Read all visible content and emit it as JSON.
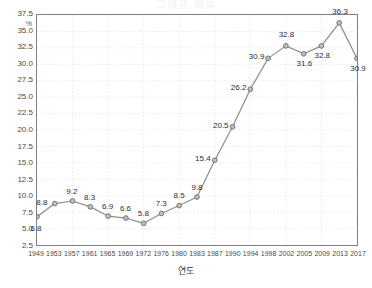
{
  "title_clipped": "그래프 제목",
  "axis": {
    "y_unit": "%",
    "x_title": "연도"
  },
  "chart_data": {
    "type": "line",
    "title": "",
    "xlabel": "연도",
    "ylabel": "%",
    "ylim": [
      2.5,
      37.5
    ],
    "ytick_step": 2.5,
    "yticks": [
      "2.5",
      "5.0",
      "7.5",
      "10.0",
      "12.5",
      "15.0",
      "17.5",
      "20.0",
      "22.5",
      "25.0",
      "27.5",
      "30.0",
      "32.5",
      "35.0",
      "37.5"
    ],
    "grid": true,
    "legend": "none",
    "marker": "circle",
    "line_color": "#8c8c8c",
    "marker_fill": "#bdbdbd",
    "marker_edge": "#6e6e6e",
    "categories": [
      "1949",
      "1953",
      "1957",
      "1961",
      "1965",
      "1969",
      "1972",
      "1976",
      "1980",
      "1983",
      "1987",
      "1990",
      "1994",
      "1998",
      "2002",
      "2005",
      "2009",
      "2013",
      "2017"
    ],
    "values": [
      6.8,
      8.8,
      9.2,
      8.3,
      6.9,
      6.6,
      5.8,
      7.3,
      8.5,
      9.8,
      15.4,
      20.5,
      26.2,
      30.9,
      32.8,
      31.6,
      32.8,
      36.3,
      30.9
    ],
    "point_labels": [
      "6.8",
      "8.8",
      "9.2",
      "8.3",
      "6.9",
      "6.6",
      "5.8",
      "7.3",
      "8.5",
      "9.8",
      "15.4",
      "20.5",
      "26.2",
      "30.9",
      "32.8",
      "31.6",
      "32.8",
      "36.3",
      "30.9"
    ],
    "label_positions": [
      "below",
      "left",
      "above",
      "above",
      "above",
      "above",
      "above",
      "above",
      "above",
      "above",
      "left",
      "left",
      "left",
      "left",
      "above",
      "below",
      "below",
      "above",
      "below"
    ]
  }
}
